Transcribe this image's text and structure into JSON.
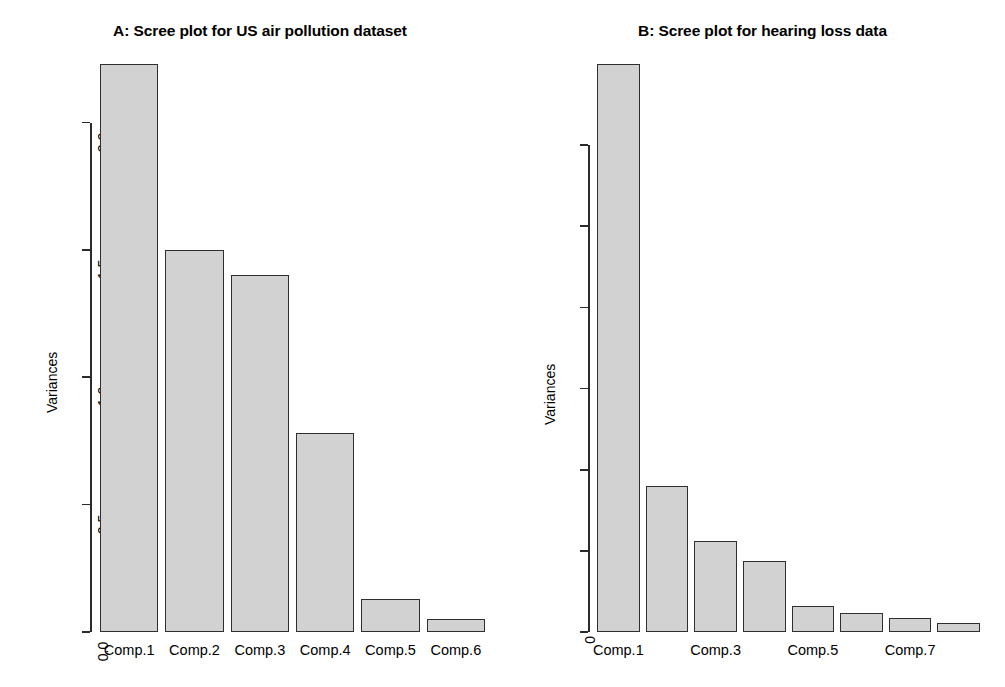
{
  "figure": {
    "background": "#ffffff",
    "bar_fill": "#d2d2d2",
    "bar_border": "#2f2f2f",
    "axis_color": "#2b2b2b"
  },
  "panels": [
    {
      "id": "panel-a",
      "title": "A: Scree plot for US air pollution dataset",
      "ylabel": "Variances",
      "yticks": [
        "0.0",
        "0.5",
        "1.0",
        "1.5",
        "2.0"
      ],
      "xlabels": [
        "Comp.1",
        "Comp.2",
        "Comp.3",
        "Comp.4",
        "Comp.5",
        "Comp.6"
      ]
    },
    {
      "id": "panel-b",
      "title": "B: Scree plot for hearing loss data",
      "ylabel": "Variances",
      "yticks": [
        "0",
        "100",
        "200",
        "300",
        "400",
        "500",
        "600"
      ],
      "xlabels": [
        "Comp.1",
        "Comp.3",
        "Comp.5",
        "Comp.7"
      ]
    }
  ],
  "chart_data": [
    {
      "type": "bar",
      "title": "A: Scree plot for US air pollution dataset",
      "xlabel": "",
      "ylabel": "Variances",
      "categories": [
        "Comp.1",
        "Comp.2",
        "Comp.3",
        "Comp.4",
        "Comp.5",
        "Comp.6"
      ],
      "values": [
        2.23,
        1.5,
        1.4,
        0.78,
        0.13,
        0.05
      ],
      "ylim": [
        0.0,
        2.23
      ],
      "ytick_values": [
        0.0,
        0.5,
        1.0,
        1.5,
        2.0
      ],
      "grid": false,
      "legend": "none"
    },
    {
      "type": "bar",
      "title": "B: Scree plot for hearing loss data",
      "xlabel": "",
      "ylabel": "Variances",
      "categories": [
        "Comp.1",
        "Comp.2",
        "Comp.3",
        "Comp.4",
        "Comp.5",
        "Comp.6",
        "Comp.7",
        "Comp.8"
      ],
      "values": [
        700,
        180,
        112,
        88,
        32,
        23,
        17,
        11
      ],
      "ylim": [
        0,
        700
      ],
      "ytick_values": [
        0,
        100,
        200,
        300,
        400,
        500,
        600
      ],
      "tick_labels_shown": [
        "Comp.1",
        "Comp.3",
        "Comp.5",
        "Comp.7"
      ],
      "grid": false,
      "legend": "none"
    }
  ]
}
